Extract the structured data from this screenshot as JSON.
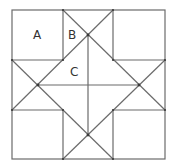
{
  "diagram": {
    "type": "quilt-block-geometry",
    "labels": [
      {
        "id": "A",
        "text": "A",
        "x": 37,
        "y": 39
      },
      {
        "id": "B",
        "text": "B",
        "x": 72,
        "y": 39
      },
      {
        "id": "C",
        "text": "C",
        "x": 74,
        "y": 75
      }
    ],
    "colors": {
      "stroke": "#6b6b6b",
      "label": "#333333",
      "background": "#ffffff"
    }
  }
}
